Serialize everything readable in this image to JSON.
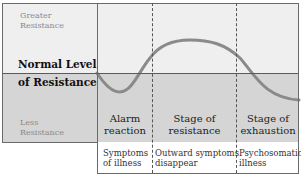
{
  "y_axis": {
    "top_label": "Greater Resistance",
    "top_label_line1": "Greater",
    "top_label_line2": "Resistance",
    "middle_label_line1": "Normal Level",
    "middle_label_line2": "of Resistance",
    "bottom_label_line1": "Less",
    "bottom_label_line2": "Resistance"
  },
  "stages": [
    {
      "name_line1": "Alarm",
      "name_line2": "reaction",
      "effect_line1": "Symptoms",
      "effect_line2": "of illness"
    },
    {
      "name_line1": "Stage of",
      "name_line2": "resistance",
      "effect_line1": "Outward symptoms",
      "effect_line2": "disappear"
    },
    {
      "name_line1": "Stage of",
      "name_line2": "exhaustion",
      "effect_line1": "Psychosomatic",
      "effect_line2": "illness"
    }
  ],
  "colors": {
    "upper_bg": "#efefef",
    "lower_bg": "#d5d5d5",
    "curve": "#8a8a8a"
  }
}
